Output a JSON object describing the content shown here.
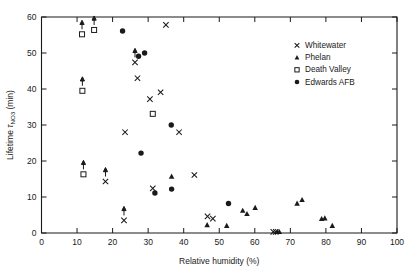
{
  "figure": {
    "background": "#ffffff",
    "foreground": "#1a1a1a"
  },
  "axes": {
    "xlabel": "Relative humidity (%)",
    "ylabel_main": "Lifetime",
    "ylabel_tau": "τ",
    "ylabel_sub": "NO",
    "ylabel_sub2": "3",
    "ylabel_unit": "(min)",
    "xticklabels": [
      "0",
      "10",
      "20",
      "30",
      "40",
      "50",
      "60",
      "70",
      "80",
      "90",
      "100"
    ],
    "yticklabels": [
      "0",
      "10",
      "20",
      "30",
      "40",
      "50",
      "60"
    ]
  },
  "legend": {
    "items": [
      {
        "label": "Whitewater",
        "marker": "cross"
      },
      {
        "label": "Phelan",
        "marker": "triangle"
      },
      {
        "label": "Death Valley",
        "marker": "open-square"
      },
      {
        "label": "Edwards AFB",
        "marker": "filled-circle"
      }
    ]
  },
  "chart_data": {
    "type": "scatter",
    "title": "",
    "xlabel": "Relative humidity (%)",
    "ylabel": "Lifetime τNO3 (min)",
    "xlim": [
      0,
      100
    ],
    "ylim": [
      0,
      60
    ],
    "xticks": [
      0,
      10,
      20,
      30,
      40,
      50,
      60,
      70,
      80,
      90,
      100
    ],
    "yticks": [
      0,
      10,
      20,
      30,
      40,
      50,
      60
    ],
    "grid": false,
    "legend_position": "upper right",
    "note": "Upward arrows on some points denote lower-limit values",
    "series": [
      {
        "name": "Whitewater",
        "marker": "cross",
        "points": [
          {
            "x": 23.2,
            "y": 3.5,
            "arrow": true
          },
          {
            "x": 18.0,
            "y": 14.3,
            "arrow": true
          },
          {
            "x": 43.0,
            "y": 16.1,
            "arrow": false
          },
          {
            "x": 31.3,
            "y": 12.4,
            "arrow": false
          },
          {
            "x": 46.7,
            "y": 4.6,
            "arrow": false
          },
          {
            "x": 48.2,
            "y": 4.0,
            "arrow": false
          },
          {
            "x": 23.5,
            "y": 28.0,
            "arrow": false
          },
          {
            "x": 26.3,
            "y": 47.4,
            "arrow": true
          },
          {
            "x": 27.0,
            "y": 43.0,
            "arrow": false
          },
          {
            "x": 30.5,
            "y": 37.2,
            "arrow": false
          },
          {
            "x": 33.5,
            "y": 39.1,
            "arrow": false
          },
          {
            "x": 35.0,
            "y": 57.8,
            "arrow": false
          },
          {
            "x": 38.7,
            "y": 28.0,
            "arrow": false
          },
          {
            "x": 65.2,
            "y": 0.3,
            "arrow": false
          },
          {
            "x": 65.9,
            "y": 0.3,
            "arrow": false
          }
        ]
      },
      {
        "name": "Phelan",
        "marker": "triangle",
        "points": [
          {
            "x": 36.6,
            "y": 15.7,
            "arrow": false
          },
          {
            "x": 46.6,
            "y": 2.2,
            "arrow": false
          },
          {
            "x": 52.1,
            "y": 2.0,
            "arrow": false
          },
          {
            "x": 56.6,
            "y": 6.2,
            "arrow": false
          },
          {
            "x": 57.8,
            "y": 5.3,
            "arrow": false
          },
          {
            "x": 60.1,
            "y": 7.0,
            "arrow": false
          },
          {
            "x": 66.3,
            "y": 0.3,
            "arrow": false
          },
          {
            "x": 66.9,
            "y": 0.3,
            "arrow": false
          },
          {
            "x": 71.9,
            "y": 8.2,
            "arrow": false
          },
          {
            "x": 73.3,
            "y": 9.2,
            "arrow": false
          },
          {
            "x": 78.8,
            "y": 3.9,
            "arrow": false
          },
          {
            "x": 79.7,
            "y": 4.1,
            "arrow": false
          },
          {
            "x": 81.8,
            "y": 2.0,
            "arrow": false
          }
        ]
      },
      {
        "name": "Death Valley",
        "marker": "open-square",
        "points": [
          {
            "x": 11.4,
            "y": 55.2,
            "arrow": true
          },
          {
            "x": 14.8,
            "y": 56.4,
            "arrow": true
          },
          {
            "x": 11.5,
            "y": 39.5,
            "arrow": true
          },
          {
            "x": 11.8,
            "y": 16.3,
            "arrow": true
          },
          {
            "x": 31.3,
            "y": 33.1,
            "arrow": false
          }
        ]
      },
      {
        "name": "Edwards AFB",
        "marker": "filled-circle",
        "points": [
          {
            "x": 22.8,
            "y": 56.1,
            "arrow": false
          },
          {
            "x": 27.3,
            "y": 49.1,
            "arrow": false
          },
          {
            "x": 29.0,
            "y": 50.0,
            "arrow": false
          },
          {
            "x": 28.0,
            "y": 22.2,
            "arrow": false
          },
          {
            "x": 31.9,
            "y": 11.1,
            "arrow": false
          },
          {
            "x": 36.5,
            "y": 30.0,
            "arrow": false
          },
          {
            "x": 36.6,
            "y": 12.2,
            "arrow": false
          },
          {
            "x": 52.6,
            "y": 8.2,
            "arrow": false
          }
        ]
      }
    ]
  }
}
